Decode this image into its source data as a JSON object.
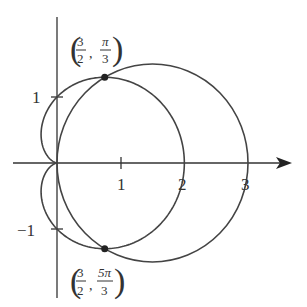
{
  "figure": {
    "type": "polar-graph",
    "curves": [
      {
        "name": "circle",
        "equation": "r = 3cos θ"
      },
      {
        "name": "cardioid",
        "equation": "r = 1 + cos θ"
      }
    ],
    "x_ticks": [
      "1",
      "2",
      "3"
    ],
    "y_ticks": [
      "1",
      "−1"
    ],
    "intersections": [
      {
        "r_num": "3",
        "r_den": "2",
        "theta_num": "π",
        "theta_den": "3"
      },
      {
        "r_num": "3",
        "r_den": "2",
        "theta_num": "5π",
        "theta_den": "3"
      }
    ],
    "colors": {
      "stroke": "#444444",
      "background": "#ffffff"
    }
  }
}
